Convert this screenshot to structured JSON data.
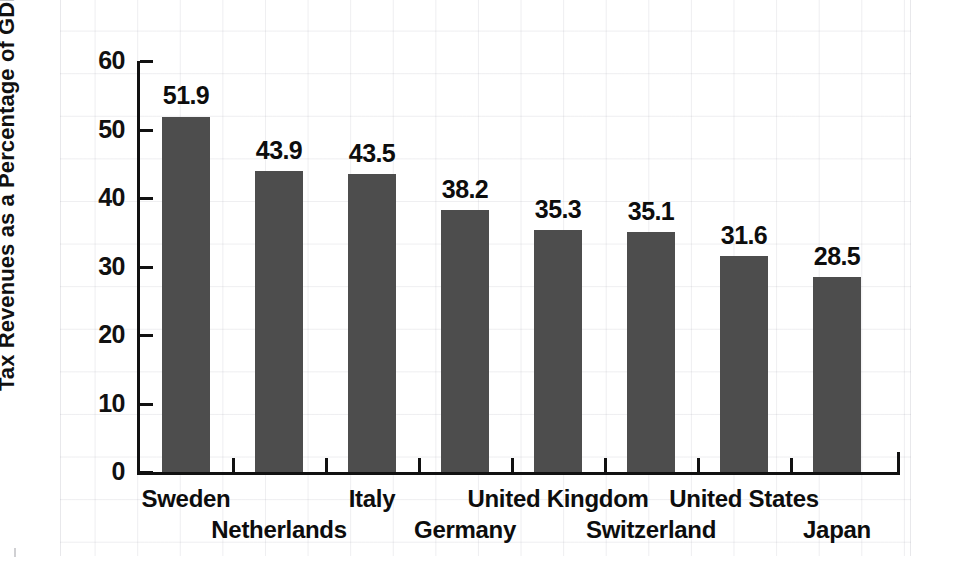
{
  "chart_data": {
    "type": "bar",
    "title": "",
    "subtitle": "",
    "xlabel": "",
    "ylabel": "Tax Revenues as a Percentage of GDP",
    "categories": [
      "Sweden",
      "Netherlands",
      "Italy",
      "Germany",
      "United Kingdom",
      "Switzerland",
      "United States",
      "Japan"
    ],
    "values": [
      51.9,
      43.9,
      43.5,
      38.2,
      35.3,
      35.1,
      31.6,
      28.5
    ],
    "value_labels": [
      "51.9",
      "43.9",
      "43.5",
      "38.2",
      "35.3",
      "35.1",
      "31.6",
      "28.5"
    ],
    "ylim": [
      0,
      60
    ],
    "ytick_values": [
      0,
      10,
      20,
      30,
      40,
      50,
      60
    ],
    "ytick_labels": [
      "0",
      "10",
      "20",
      "30",
      "40",
      "50",
      "60"
    ],
    "grid": false,
    "legend": "none",
    "bar_color": "#4d4d4d",
    "axis_color": "#111111",
    "text_color": "#0d0d0d",
    "background_color": "#ffffff",
    "label_rows": [
      0,
      1,
      0,
      1,
      0,
      1,
      0,
      1
    ]
  }
}
